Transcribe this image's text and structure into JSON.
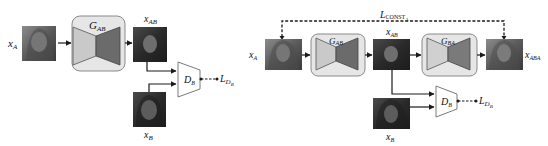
{
  "colors": {
    "generator_box_fill": "#e6e6e6",
    "generator_box_stroke": "#8a8a8a",
    "encoder_fill": "#c9c9c9",
    "decoder_fill": "#6b6b6b",
    "arrow": "#1a1a1a",
    "photo_dark": "#2b2b2b",
    "photo_mid": "#6a6a6a"
  },
  "left_diagram": {
    "input_label": "x",
    "input_sub": "A",
    "generator_label": "G",
    "generator_sub": "AB",
    "output_label": "x",
    "output_sub": "AB",
    "real_label": "x",
    "real_sub": "B",
    "discriminator_label": "D",
    "discriminator_sub": "B",
    "loss_label": "L",
    "loss_sub": "D",
    "loss_subsub": "B"
  },
  "right_diagram": {
    "const_loss_label": "L",
    "const_loss_sub": "CONST",
    "const_loss_subsub": "A",
    "input_label": "x",
    "input_sub": "A",
    "generator1_label": "G",
    "generator1_sub": "AB",
    "mid_label": "x",
    "mid_sub": "AB",
    "generator2_label": "G",
    "generator2_sub": "BA",
    "recon_label": "x",
    "recon_sub": "ABA",
    "real_label": "x",
    "real_sub": "B",
    "discriminator_label": "D",
    "discriminator_sub": "B",
    "loss_label": "L",
    "loss_sub": "D",
    "loss_subsub": "B"
  }
}
